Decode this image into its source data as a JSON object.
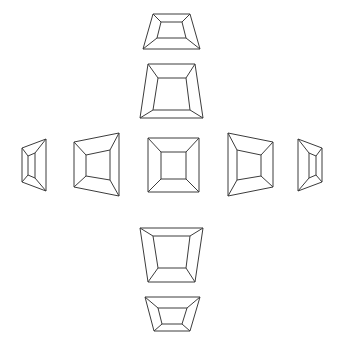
{
  "figure": {
    "background_color": "#ffffff",
    "line_color": "#3c3c3c",
    "line_width": 1,
    "canvas": {
      "width": 343,
      "height": 351
    },
    "layout": "cross",
    "view_count": 11,
    "rows": 5,
    "columns": 5
  },
  "views": [
    {
      "id": "view-top-far",
      "label": "top-far",
      "grid": {
        "row": 1,
        "col": 3
      },
      "elevation_deg": 60,
      "azimuth_deg": 0,
      "center": {
        "x": 171,
        "y": 31
      },
      "outer": [
        [
          153,
          14
        ],
        [
          190,
          14
        ],
        [
          200,
          49
        ],
        [
          143,
          49
        ]
      ],
      "inner": [
        [
          161,
          22
        ],
        [
          182,
          22
        ],
        [
          186,
          38
        ],
        [
          157,
          38
        ]
      ]
    },
    {
      "id": "view-top-near",
      "label": "top-near",
      "grid": {
        "row": 2,
        "col": 3
      },
      "elevation_deg": 30,
      "azimuth_deg": 0,
      "center": {
        "x": 171,
        "y": 91
      },
      "outer": [
        [
          148,
          64
        ],
        [
          195,
          64
        ],
        [
          203,
          118
        ],
        [
          140,
          118
        ]
      ],
      "inner": [
        [
          158,
          78
        ],
        [
          186,
          78
        ],
        [
          190,
          110
        ],
        [
          153,
          110
        ]
      ]
    },
    {
      "id": "view-left-far",
      "label": "left-far",
      "grid": {
        "row": 3,
        "col": 1
      },
      "elevation_deg": 0,
      "azimuth_deg": -60,
      "center": {
        "x": 34,
        "y": 165
      },
      "outer": [
        [
          22,
          148
        ],
        [
          46,
          139
        ],
        [
          46,
          191
        ],
        [
          22,
          182
        ]
      ],
      "inner": [
        [
          28,
          156
        ],
        [
          35,
          153
        ],
        [
          35,
          178
        ],
        [
          28,
          175
        ]
      ]
    },
    {
      "id": "view-left-near",
      "label": "left-near",
      "grid": {
        "row": 3,
        "col": 2
      },
      "elevation_deg": 0,
      "azimuth_deg": -30,
      "center": {
        "x": 96,
        "y": 165
      },
      "outer": [
        [
          74,
          142
        ],
        [
          119,
          133
        ],
        [
          119,
          196
        ],
        [
          74,
          187
        ]
      ],
      "inner": [
        [
          86,
          155
        ],
        [
          110,
          150
        ],
        [
          110,
          180
        ],
        [
          86,
          176
        ]
      ]
    },
    {
      "id": "view-center",
      "label": "center-frontal",
      "grid": {
        "row": 3,
        "col": 3
      },
      "elevation_deg": 0,
      "azimuth_deg": 0,
      "center": {
        "x": 173,
        "y": 165
      },
      "outer": [
        [
          148,
          138
        ],
        [
          199,
          138
        ],
        [
          199,
          192
        ],
        [
          148,
          192
        ]
      ],
      "inner": [
        [
          161,
          152
        ],
        [
          186,
          152
        ],
        [
          186,
          179
        ],
        [
          161,
          179
        ]
      ]
    },
    {
      "id": "view-right-near",
      "label": "right-near",
      "grid": {
        "row": 3,
        "col": 4
      },
      "elevation_deg": 0,
      "azimuth_deg": 30,
      "center": {
        "x": 250,
        "y": 165
      },
      "outer": [
        [
          228,
          133
        ],
        [
          273,
          142
        ],
        [
          273,
          187
        ],
        [
          228,
          196
        ]
      ],
      "inner": [
        [
          237,
          150
        ],
        [
          261,
          155
        ],
        [
          261,
          176
        ],
        [
          237,
          180
        ]
      ]
    },
    {
      "id": "view-right-far",
      "label": "right-far",
      "grid": {
        "row": 3,
        "col": 5
      },
      "elevation_deg": 0,
      "azimuth_deg": 60,
      "center": {
        "x": 310,
        "y": 165
      },
      "outer": [
        [
          298,
          139
        ],
        [
          322,
          148
        ],
        [
          322,
          182
        ],
        [
          298,
          191
        ]
      ],
      "inner": [
        [
          309,
          153
        ],
        [
          316,
          156
        ],
        [
          316,
          175
        ],
        [
          309,
          178
        ]
      ]
    },
    {
      "id": "view-bottom-near",
      "label": "bottom-near",
      "grid": {
        "row": 4,
        "col": 3
      },
      "elevation_deg": -30,
      "azimuth_deg": 0,
      "center": {
        "x": 171,
        "y": 255
      },
      "outer": [
        [
          140,
          228
        ],
        [
          203,
          228
        ],
        [
          195,
          282
        ],
        [
          148,
          282
        ]
      ],
      "inner": [
        [
          153,
          236
        ],
        [
          190,
          236
        ],
        [
          186,
          268
        ],
        [
          158,
          268
        ]
      ]
    },
    {
      "id": "view-bottom-far",
      "label": "bottom-far",
      "grid": {
        "row": 5,
        "col": 3
      },
      "elevation_deg": -60,
      "azimuth_deg": 0,
      "center": {
        "x": 171,
        "y": 312
      },
      "outer": [
        [
          145,
          297
        ],
        [
          200,
          297
        ],
        [
          190,
          331
        ],
        [
          154,
          331
        ]
      ],
      "inner": [
        [
          158,
          308
        ],
        [
          187,
          308
        ],
        [
          182,
          324
        ],
        [
          162,
          324
        ]
      ]
    }
  ]
}
